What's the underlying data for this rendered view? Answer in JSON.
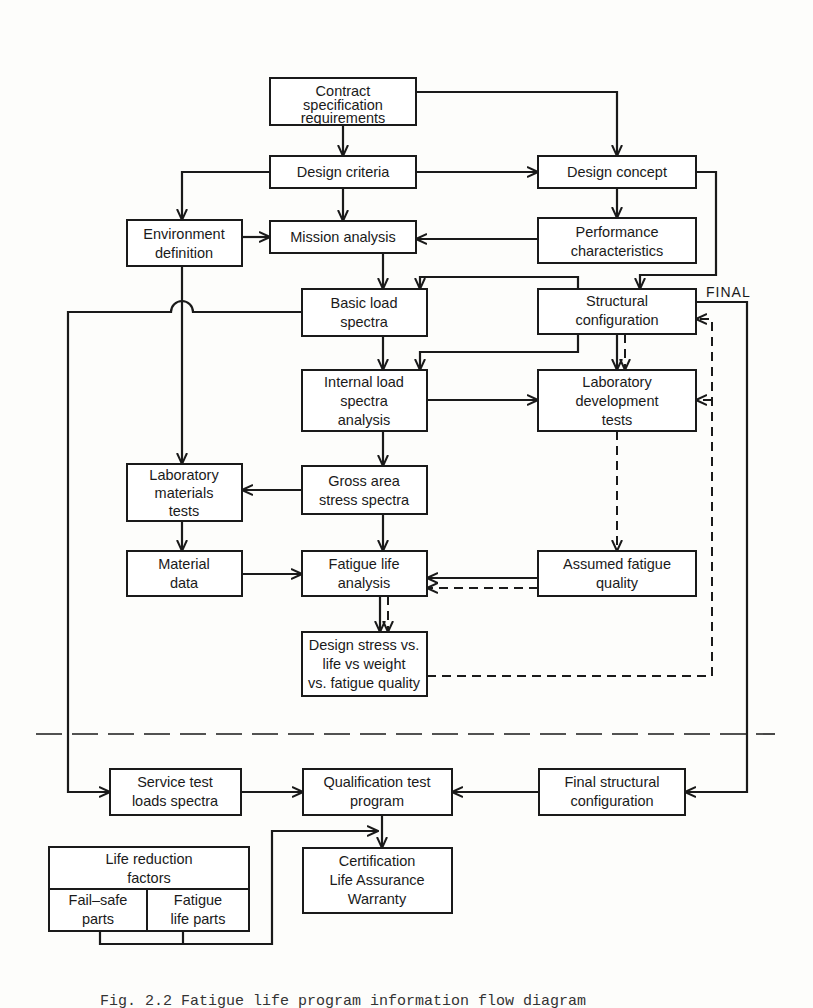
{
  "diagram": {
    "boxes": {
      "contract": [
        "Contract",
        "specification",
        "requirements"
      ],
      "design_criteria": [
        "Design criteria"
      ],
      "design_concept": [
        "Design concept"
      ],
      "environment": [
        "Environment",
        "definition"
      ],
      "mission": [
        "Mission analysis"
      ],
      "performance": [
        "Performance",
        "characteristics"
      ],
      "basic_load": [
        "Basic load",
        "spectra"
      ],
      "structural": [
        "Structural",
        "configuration"
      ],
      "internal_load": [
        "Internal load",
        "spectra",
        "analysis"
      ],
      "lab_dev": [
        "Laboratory",
        "development",
        "tests"
      ],
      "lab_materials": [
        "Laboratory",
        "materials",
        "tests"
      ],
      "gross_area": [
        "Gross area",
        "stress spectra"
      ],
      "material_data": [
        "Material",
        "data"
      ],
      "fatigue_life": [
        "Fatigue life",
        "analysis"
      ],
      "assumed_quality": [
        "Assumed fatigue",
        "quality"
      ],
      "design_stress": [
        "Design stress vs.",
        "life vs weight",
        "vs. fatigue quality"
      ],
      "service_test": [
        "Service test",
        "loads spectra"
      ],
      "qualification": [
        "Qualification test",
        "program"
      ],
      "final_structural": [
        "Final structural",
        "configuration"
      ],
      "life_reduction": [
        "Life reduction",
        "factors"
      ],
      "fail_safe": [
        "Fail–safe",
        "parts"
      ],
      "fatigue_parts": [
        "Fatigue",
        "life parts"
      ],
      "certification": [
        "Certification",
        "Life Assurance",
        "Warranty"
      ]
    },
    "labels": {
      "final": "FINAL"
    }
  },
  "caption": "Fig. 2.2  Fatigue life program information flow diagram"
}
